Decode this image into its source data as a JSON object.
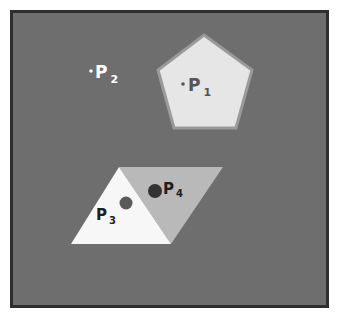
{
  "colors": {
    "page_bg": "#ffffff",
    "frame_fill": "#6e6e6e",
    "frame_border": "#2e2e2e",
    "pentagon_fill": "#e6e6e6",
    "pentagon_stroke": "#9a9a9a",
    "triangle_left_fill": "#f7f7f7",
    "triangle_right_fill": "#b9b9b9",
    "p1_color": "#555555",
    "p2_color": "#ffffff",
    "p3_dot": "#5a5a5a",
    "p4_dot": "#333333",
    "label_dark": "#1e1e1e"
  },
  "points": {
    "p1": {
      "label": "P",
      "subscript": "1"
    },
    "p2": {
      "label": "P",
      "subscript": "2"
    },
    "p3": {
      "label": "P",
      "subscript": "3"
    },
    "p4": {
      "label": "P",
      "subscript": "4"
    }
  }
}
